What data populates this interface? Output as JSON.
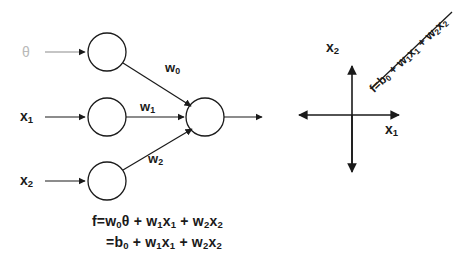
{
  "diagram": {
    "colors": {
      "stroke": "#1a1a1a",
      "text": "#1a1a1a",
      "theta_text": "#b9b9b9",
      "background": "#ffffff"
    },
    "network": {
      "inputs": [
        {
          "id": "bias",
          "label": "θ",
          "muted": true
        },
        {
          "id": "x1",
          "label_main": "x",
          "label_sub": "1"
        },
        {
          "id": "x2",
          "label_main": "x",
          "label_sub": "2"
        }
      ],
      "weights": [
        {
          "id": "w0",
          "label_main": "w",
          "label_sub": "0"
        },
        {
          "id": "w1",
          "label_main": "w",
          "label_sub": "1"
        },
        {
          "id": "w2",
          "label_main": "w",
          "label_sub": "2"
        }
      ],
      "node_count": 4,
      "output_label": ""
    },
    "formula": {
      "line1": {
        "segments": [
          {
            "t": "f=w"
          },
          {
            "t": "0",
            "sub": true
          },
          {
            "t": "θ + w"
          },
          {
            "t": "1",
            "sub": true
          },
          {
            "t": "x"
          },
          {
            "t": "1",
            "sub": true
          },
          {
            "t": " + w"
          },
          {
            "t": "2",
            "sub": true
          },
          {
            "t": "x"
          },
          {
            "t": "2",
            "sub": true
          }
        ],
        "plain": "f=w0θ + w1x1 + w2x2"
      },
      "line2": {
        "segments": [
          {
            "t": "=b"
          },
          {
            "t": "0",
            "sub": true
          },
          {
            "t": " + w"
          },
          {
            "t": "1",
            "sub": true
          },
          {
            "t": "x"
          },
          {
            "t": "1",
            "sub": true
          },
          {
            "t": " + w"
          },
          {
            "t": "2",
            "sub": true
          },
          {
            "t": "x"
          },
          {
            "t": "2",
            "sub": true
          }
        ],
        "plain": "=b0 + w1x1 + w2x2"
      }
    },
    "plot": {
      "y_axis_label_main": "x",
      "y_axis_label_sub": "2",
      "x_axis_label_main": "x",
      "x_axis_label_sub": "1",
      "line_label": {
        "segments": [
          {
            "t": "f=b"
          },
          {
            "t": "0",
            "sub": true
          },
          {
            "t": " + w"
          },
          {
            "t": "1",
            "sub": true
          },
          {
            "t": "x"
          },
          {
            "t": "1",
            "sub": true
          },
          {
            "t": " + w"
          },
          {
            "t": "2",
            "sub": true
          },
          {
            "t": "x"
          },
          {
            "t": "2",
            "sub": true
          }
        ],
        "plain": "f=b0 + w1x1 + w2x2"
      }
    }
  }
}
